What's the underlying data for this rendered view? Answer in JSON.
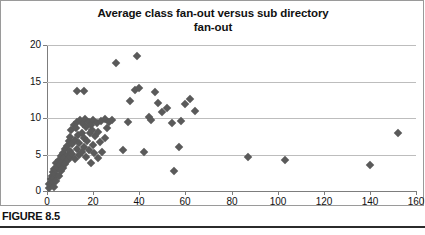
{
  "figure": {
    "caption": "FIGURE 8.5"
  },
  "chart_data": {
    "type": "scatter",
    "title_lines": [
      "Average class fan-out versus sub directory",
      "fan-out"
    ],
    "title": "Average class fan-out versus sub directory fan-out",
    "xlabel": "",
    "ylabel": "",
    "xlim": [
      0,
      160
    ],
    "ylim": [
      0,
      20
    ],
    "xticks": [
      0,
      20,
      40,
      60,
      80,
      100,
      120,
      140,
      160
    ],
    "yticks": [
      0,
      5,
      10,
      15,
      20
    ],
    "grid": "horizontal",
    "legend": "none",
    "marker": "diamond",
    "marker_color": "#5a5a5a",
    "series": [
      {
        "name": "sub directory fan-out",
        "points": [
          [
            1,
            0.4
          ],
          [
            1,
            1.0
          ],
          [
            1.5,
            1.6
          ],
          [
            2,
            0.8
          ],
          [
            2,
            2.0
          ],
          [
            2.5,
            1.2
          ],
          [
            2.5,
            2.6
          ],
          [
            3,
            0.5
          ],
          [
            3,
            1.8
          ],
          [
            3,
            3.0
          ],
          [
            3.5,
            2.3
          ],
          [
            4,
            1.4
          ],
          [
            4,
            2.9
          ],
          [
            4,
            3.8
          ],
          [
            4.5,
            3.3
          ],
          [
            5,
            2.1
          ],
          [
            5,
            4.3
          ],
          [
            5.5,
            3.6
          ],
          [
            6,
            2.7
          ],
          [
            6,
            4.8
          ],
          [
            6.5,
            4.0
          ],
          [
            7,
            3.2
          ],
          [
            7,
            5.2
          ],
          [
            7.5,
            4.5
          ],
          [
            8,
            3.7
          ],
          [
            8,
            5.7
          ],
          [
            8.5,
            6.2
          ],
          [
            9,
            4.2
          ],
          [
            9,
            5.0
          ],
          [
            9.5,
            6.8
          ],
          [
            10,
            4.6
          ],
          [
            10,
            5.5
          ],
          [
            10,
            7.4
          ],
          [
            10.5,
            8.3
          ],
          [
            11,
            5.1
          ],
          [
            11,
            6.4
          ],
          [
            11.5,
            9.0
          ],
          [
            12,
            4.4
          ],
          [
            12,
            7.0
          ],
          [
            12.5,
            8.6
          ],
          [
            13,
            5.8
          ],
          [
            13,
            9.4
          ],
          [
            13,
            13.7
          ],
          [
            13.5,
            7.7
          ],
          [
            14,
            4.9
          ],
          [
            14,
            6.6
          ],
          [
            14.5,
            9.7
          ],
          [
            15,
            5.4
          ],
          [
            15,
            8.0
          ],
          [
            15.5,
            9.2
          ],
          [
            16,
            6.0
          ],
          [
            16,
            7.3
          ],
          [
            16.5,
            9.9
          ],
          [
            17,
            4.7
          ],
          [
            17,
            8.8
          ],
          [
            17.5,
            6.9
          ],
          [
            18,
            9.5
          ],
          [
            18,
            5.6
          ],
          [
            18.5,
            7.9
          ],
          [
            19,
            9.1
          ],
          [
            19,
            3.9
          ],
          [
            19.5,
            8.4
          ],
          [
            20,
            6.3
          ],
          [
            20,
            9.8
          ],
          [
            20.5,
            5.2
          ],
          [
            21,
            7.6
          ],
          [
            21.5,
            9.3
          ],
          [
            22,
            4.5
          ],
          [
            22,
            8.1
          ],
          [
            23,
            6.7
          ],
          [
            23.5,
            9.6
          ],
          [
            24,
            5.3
          ],
          [
            25,
            7.2
          ],
          [
            25,
            9.9
          ],
          [
            26,
            8.7
          ],
          [
            27,
            9.5
          ],
          [
            28,
            9.8
          ],
          [
            16,
            13.7
          ],
          [
            30,
            17.5
          ],
          [
            39,
            18.5
          ],
          [
            33,
            5.6
          ],
          [
            35,
            9.4
          ],
          [
            36,
            12.3
          ],
          [
            38,
            13.9
          ],
          [
            40,
            14.1
          ],
          [
            42,
            5.3
          ],
          [
            44,
            10.2
          ],
          [
            45,
            9.7
          ],
          [
            47,
            13.5
          ],
          [
            48,
            12.1
          ],
          [
            50,
            10.8
          ],
          [
            52,
            11.4
          ],
          [
            54,
            9.3
          ],
          [
            55,
            2.7
          ],
          [
            57,
            6.0
          ],
          [
            58,
            9.6
          ],
          [
            60,
            11.9
          ],
          [
            62,
            12.6
          ],
          [
            64,
            10.9
          ],
          [
            87,
            4.7
          ],
          [
            103,
            4.3
          ],
          [
            140,
            3.6
          ],
          [
            152,
            8.0
          ]
        ]
      }
    ]
  }
}
